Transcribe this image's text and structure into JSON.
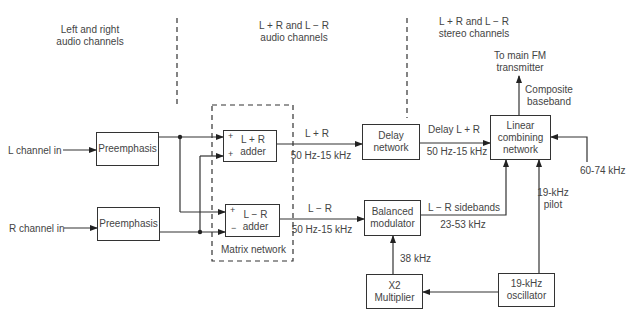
{
  "sections": {
    "left": "Left and right\naudio channels",
    "middle": "L + R and L − R\naudio channels",
    "right": "L + R and L − R\nstereo channels"
  },
  "inputs": {
    "left": "L channel in",
    "right": "R channel in",
    "subcarrier": "60-74 kHz"
  },
  "blocks": {
    "preemph_l": "Preemphasis",
    "preemph_r": "Preemphasis",
    "adder_sum": "L + R\nadder",
    "adder_diff": "L − R\nadder",
    "matrix": "Matrix network",
    "delay": "Delay\nnetwork",
    "balmod": "Balanced\nmodulator",
    "multiplier": "X2\nMultiplier",
    "oscillator": "19-kHz\noscillator",
    "combiner": "Linear\ncombining\nnetwork"
  },
  "signs": {
    "sum_a": "+",
    "sum_b": "+",
    "diff_a": "+",
    "diff_b": "−"
  },
  "signals": {
    "sum_name": "L + R",
    "sum_band": "50 Hz-15 kHz",
    "diff_name": "L − R",
    "diff_band": "50 Hz-15 kHz",
    "delay_name": "Delay L + R",
    "delay_band": "50 Hz-15 kHz",
    "sidebands_name": "L − R sidebands",
    "sidebands_band": "23-53 kHz",
    "carrier": "38 kHz",
    "pilot": "19-kHz\npilot",
    "composite": "Composite\nbaseband",
    "output": "To main FM\ntransmitter"
  }
}
